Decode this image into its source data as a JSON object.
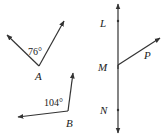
{
  "figure": {
    "angles": [
      {
        "vertex_label": "A",
        "measure_label": "76°",
        "vertex": [
          39,
          66
        ],
        "ray_ends": [
          [
            7,
            35
          ],
          [
            64,
            21
          ]
        ],
        "measure_pos": [
          28,
          55
        ],
        "vertex_label_pos": [
          35,
          80
        ]
      },
      {
        "vertex_label": "B",
        "measure_label": "104°",
        "vertex": [
          68,
          111
        ],
        "ray_ends": [
          [
            18,
            117
          ],
          [
            73,
            73
          ]
        ],
        "measure_pos": [
          44,
          106
        ],
        "vertex_label_pos": [
          66,
          127
        ]
      }
    ],
    "line": {
      "x": 118,
      "top": 4,
      "bottom": 133,
      "points": [
        {
          "label": "L",
          "y": 21,
          "label_pos": [
            100,
            27
          ]
        },
        {
          "label": "M",
          "y": 65,
          "label_pos": [
            98,
            71
          ]
        },
        {
          "label": "N",
          "y": 110,
          "label_pos": [
            100,
            114
          ]
        }
      ]
    },
    "ray": {
      "label": "P",
      "from": [
        118,
        65
      ],
      "to": [
        160,
        38
      ],
      "label_pos": [
        144,
        59
      ]
    },
    "colors": {
      "stroke": "#333333",
      "text": "#222222",
      "background": "#ffffff"
    }
  }
}
